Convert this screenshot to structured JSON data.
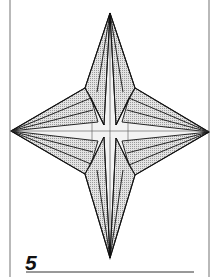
{
  "diagram": {
    "step_number": "5",
    "colors": {
      "ink": "#111111",
      "frame": "#8a8a8a",
      "shade_fill": "#d9d9d9",
      "light_fill": "#f2f2f2",
      "background": "#ffffff"
    },
    "tips": {
      "top": [
        110,
        13
      ],
      "bottom": [
        110,
        258
      ],
      "left": [
        11,
        131
      ],
      "right": [
        209,
        132
      ]
    },
    "center": [
      110,
      131
    ]
  }
}
